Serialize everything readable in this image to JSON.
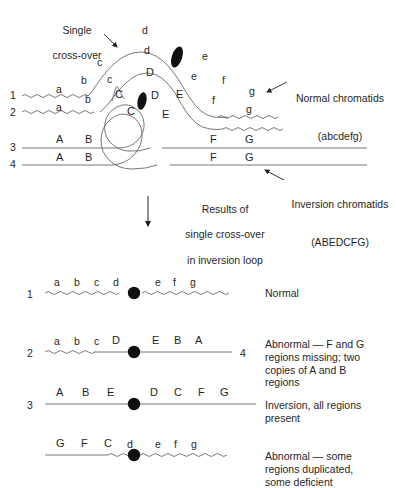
{
  "figure": {
    "title_present": false,
    "background_color": "#ffffff",
    "ink_color": "#1f1f1f",
    "line_color": "#555555",
    "centromere_color": "#111111"
  },
  "annotations": {
    "single_crossover": "Single\ncross-over",
    "single_crossover_line1": "Single",
    "single_crossover_line2": "cross-over",
    "normal_chromatids_line1": "Normal chromatids",
    "normal_chromatids_line2": "(abcdefg)",
    "inversion_chromatids_line1": "Inversion chromatids",
    "inversion_chromatids_line2": "(ABEDCFG)",
    "results_line1": "Results of",
    "results_line2": "single cross-over",
    "results_line3": "in inversion loop"
  },
  "pairing_diagram": {
    "strand_numbers": [
      "1",
      "2",
      "3",
      "4"
    ],
    "normal_strand_1_labels": [
      "a",
      "b",
      "c",
      "d",
      "e",
      "f",
      "g"
    ],
    "normal_strand_2_labels": [
      "a",
      "b",
      "c",
      "d",
      "e",
      "f",
      "g"
    ],
    "inversion_strand_3_labels": [
      "A",
      "B",
      "C",
      "D",
      "E",
      "F",
      "G"
    ],
    "inversion_strand_4_labels": [
      "A",
      "B",
      "C",
      "D",
      "E",
      "F",
      "G"
    ],
    "loop_labels_upper": [
      "C",
      "D",
      "E"
    ],
    "loop_labels_lower": [
      "C",
      "D",
      "E"
    ],
    "centromere_count": 2
  },
  "results": [
    {
      "number": "1",
      "number_right": "",
      "left_labels": [
        "a",
        "b",
        "c",
        "d"
      ],
      "right_labels": [
        "e",
        "f",
        "g"
      ],
      "left_style": "wavy",
      "right_style": "wavy",
      "description": "Normal"
    },
    {
      "number": "2",
      "number_right": "4",
      "left_labels": [
        "a",
        "b",
        "c",
        "D"
      ],
      "right_labels": [
        "E",
        "B",
        "A"
      ],
      "left_style": "wavy",
      "right_style": "straight",
      "description": "Abnormal — F and G\nregions missing; two\ncopies of A and B\nregions"
    },
    {
      "number": "3",
      "number_right": "",
      "left_labels": [
        "A",
        "B",
        "E"
      ],
      "right_labels": [
        "D",
        "C",
        "F",
        "G"
      ],
      "left_style": "straight",
      "right_style": "straight",
      "description": "Inversion, all regions\npresent"
    },
    {
      "number": "",
      "number_right": "",
      "left_labels": [
        "G",
        "F",
        "C",
        "d"
      ],
      "right_labels": [
        "e",
        "f",
        "g"
      ],
      "left_style": "straight",
      "right_style": "wavy",
      "description": "Abnormal — some\nregions duplicated,\nsome deficient"
    }
  ]
}
